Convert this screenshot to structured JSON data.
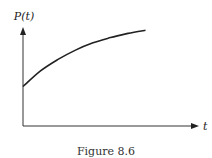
{
  "figure": {
    "caption": "Figure 8.6",
    "y_axis_label": "P(t)",
    "x_axis_label": "t",
    "curve_description": "increasing, concave-down (saturating growth) curve starting above zero on the P(t) axis",
    "colors": {
      "ink": "#222222",
      "background": "#ffffff"
    }
  },
  "chart_data": {
    "type": "line",
    "title": "",
    "xlabel": "t",
    "ylabel": "P(t)",
    "grid": false,
    "legend": "none",
    "xlim": [
      0,
      1
    ],
    "ylim": [
      0,
      1
    ],
    "series": [
      {
        "name": "P(t)",
        "x": [
          0,
          0.1,
          0.2,
          0.3,
          0.4,
          0.5,
          0.6,
          0.7
        ],
        "y": [
          0.38,
          0.53,
          0.64,
          0.73,
          0.8,
          0.85,
          0.89,
          0.92
        ]
      }
    ]
  }
}
